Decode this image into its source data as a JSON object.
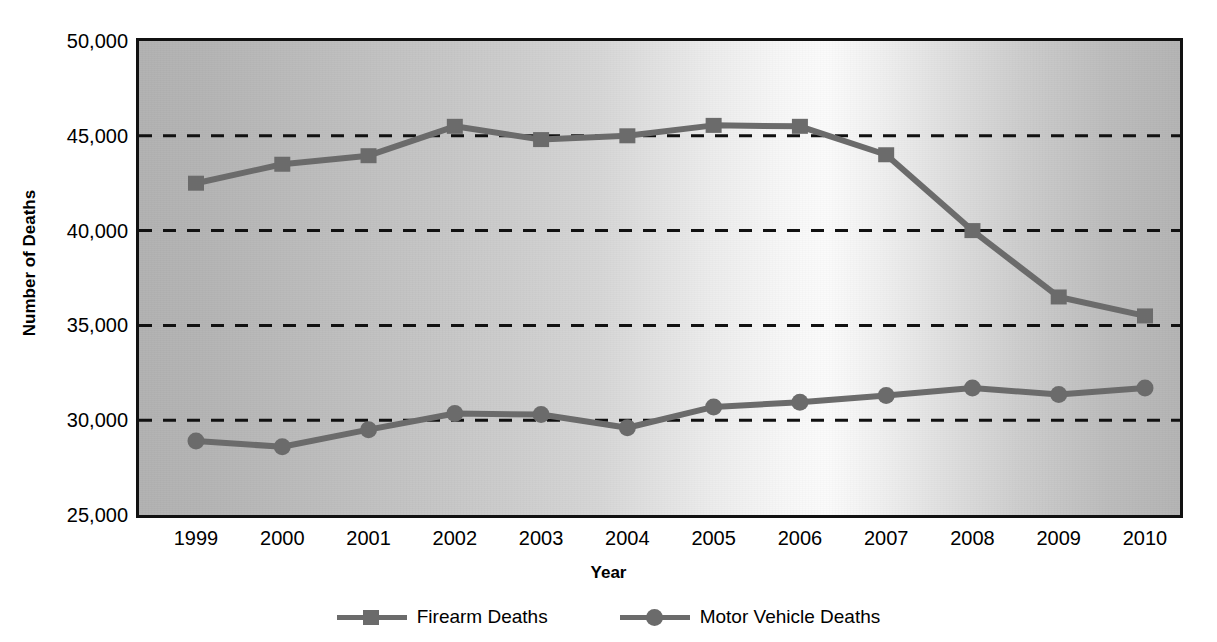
{
  "chart_data": {
    "type": "line",
    "title": "",
    "xlabel": "Year",
    "ylabel": "Number of Deaths",
    "categories": [
      "1999",
      "2000",
      "2001",
      "2002",
      "2003",
      "2004",
      "2005",
      "2006",
      "2007",
      "2008",
      "2009",
      "2010"
    ],
    "x": [
      1999,
      2000,
      2001,
      2002,
      2003,
      2004,
      2005,
      2006,
      2007,
      2008,
      2009,
      2010
    ],
    "series": [
      {
        "name": "Firearm Deaths",
        "marker": "square",
        "color": "#6b6b6b",
        "values": [
          42500,
          43500,
          43950,
          45500,
          44800,
          45000,
          45550,
          45500,
          44000,
          40000,
          36500,
          35500
        ]
      },
      {
        "name": "Motor Vehicle Deaths",
        "marker": "circle",
        "color": "#6b6b6b",
        "values": [
          28900,
          28600,
          29500,
          30350,
          30300,
          29600,
          30700,
          30950,
          31300,
          31700,
          31350,
          31700
        ]
      }
    ],
    "ylim": [
      25000,
      50000
    ],
    "y_ticks": [
      25000,
      30000,
      35000,
      40000,
      45000,
      50000
    ],
    "y_tick_labels": [
      "25,000",
      "30,000",
      "35,000",
      "40,000",
      "45,000",
      "50,000"
    ],
    "grid": "horizontal-dashed",
    "grid_color": "#111111",
    "legend_position": "bottom-center",
    "plot_border_color": "#111111",
    "plot_background": "gray-gradient"
  },
  "legend": {
    "entries": [
      {
        "label": "Firearm Deaths"
      },
      {
        "label": "Motor Vehicle Deaths"
      }
    ]
  }
}
